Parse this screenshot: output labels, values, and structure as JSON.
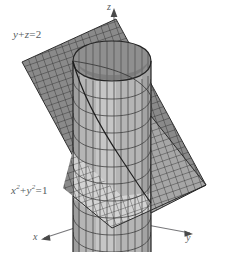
{
  "figure": {
    "kind": "3d-surface-diagram",
    "background_color": "#ffffff",
    "line_color": "#2b2b2b",
    "label_color": "#555c60"
  },
  "labels": {
    "plane_equation": {
      "lhs_var1": "y",
      "op1": "+",
      "lhs_var2": "z",
      "eq": "=",
      "rhs": "2"
    },
    "cylinder_equation": {
      "var1": "x",
      "exp1": "2",
      "op1": "+",
      "var2": "y",
      "exp2": "2",
      "eq": "=",
      "rhs": "1"
    },
    "axis_z": "z",
    "axis_x": "x",
    "axis_y": "y"
  },
  "surfaces": {
    "cylinder": {
      "name": "cylinder-x2-y2-1",
      "fill_front": "#b9b9b9",
      "fill_inside": "#8e8e8e",
      "fill_top_rim": "#cfcfcf",
      "mesh_color": "#3a3a3a"
    },
    "plane": {
      "name": "plane-y-z-2",
      "fill": "#8a8a8a",
      "fill_light": "#d2d2d2",
      "mesh_color": "#2e2e2e"
    }
  },
  "axes": {
    "z": {
      "direction": "up",
      "arrow": true
    },
    "x": {
      "direction": "down-left",
      "arrow": true
    },
    "y": {
      "direction": "down-right",
      "arrow": true
    },
    "axis_color": "#6b6b6b"
  }
}
